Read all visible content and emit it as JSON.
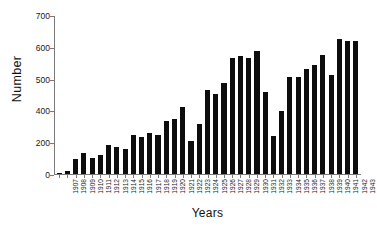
{
  "chart_data": {
    "type": "bar",
    "title": "",
    "subtitle": "",
    "xlabel": "Years",
    "ylabel": "Number",
    "ylim": [
      0,
      700
    ],
    "xlim_categories": [
      "1907",
      "1943"
    ],
    "grid": false,
    "legend": null,
    "legend_position": "none",
    "y_ticks": [
      700,
      600,
      500,
      400,
      200,
      0
    ],
    "y_tick_labels": [
      "700",
      "600",
      "500",
      "400",
      "200",
      "0"
    ],
    "bar_color": "#0d0d0d",
    "axis_color": "#7a7a7a",
    "background_color": "#ffffff",
    "categories": [
      "1907",
      "1908",
      "1909",
      "1910",
      "1911",
      "1912",
      "1913",
      "1914",
      "1915",
      "1916",
      "1917",
      "1918",
      "1919",
      "1920",
      "1921",
      "1922",
      "1923",
      "1924",
      "1925",
      "1926",
      "1927",
      "1928",
      "1929",
      "1930",
      "1931",
      "1932",
      "1933",
      "1934",
      "1935",
      "1936",
      "1937",
      "1938",
      "1939",
      "1940",
      "1941",
      "1942",
      "1943"
    ],
    "values": [
      3,
      12,
      68,
      95,
      72,
      85,
      128,
      120,
      110,
      175,
      165,
      182,
      175,
      237,
      243,
      298,
      145,
      220,
      372,
      355,
      403,
      512,
      522,
      512,
      545,
      363,
      170,
      278,
      432,
      430,
      465,
      483,
      528,
      438,
      597,
      588,
      588
    ],
    "annotations": []
  },
  "axes": {
    "y_title": "Number",
    "x_title": "Years"
  }
}
